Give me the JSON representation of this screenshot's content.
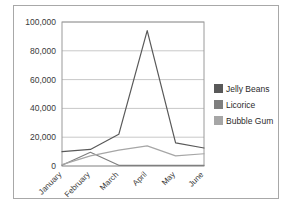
{
  "chart_data": {
    "type": "line",
    "title": "",
    "subtitle": "",
    "xlabel": "",
    "ylabel": "",
    "categories": [
      "January",
      "February",
      "March",
      "April",
      "May",
      "June"
    ],
    "series": [
      {
        "name": "Jelly Beans",
        "color": "#595959",
        "values": [
          10000,
          11500,
          22000,
          94000,
          16000,
          12500
        ]
      },
      {
        "name": "Licorice",
        "color": "#7f7f7f",
        "values": [
          500,
          9500,
          500,
          500,
          500,
          500
        ]
      },
      {
        "name": "Bubble Gum",
        "color": "#a6a6a6",
        "values": [
          1000,
          7000,
          11000,
          14000,
          7000,
          8500
        ]
      }
    ],
    "ylim": [
      0,
      100000
    ],
    "yticks": [
      0,
      20000,
      40000,
      60000,
      80000,
      100000
    ],
    "ytick_labels": [
      "0",
      "20,000",
      "40,000",
      "60,000",
      "80,000",
      "100,000"
    ],
    "grid": true,
    "grid_axis": "y",
    "legend_position": "right",
    "xtick_rotation": -45,
    "frame_color": "#a8a8a8",
    "plot_border_color": "#9a9a9a",
    "gridline_color": "#c8c8c8",
    "background": "#ffffff"
  },
  "legend": {
    "entries": [
      {
        "label": "Jelly Beans",
        "swatch": "#595959"
      },
      {
        "label": "Licorice",
        "swatch": "#7f7f7f"
      },
      {
        "label": "Bubble Gum",
        "swatch": "#a6a6a6"
      }
    ]
  }
}
